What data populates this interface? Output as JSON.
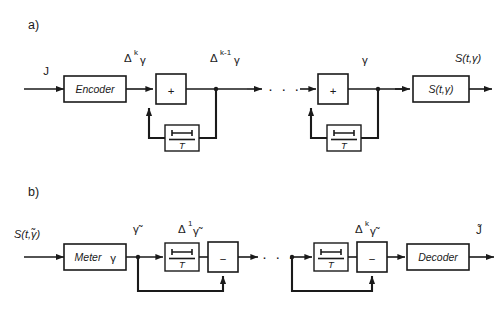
{
  "figure": {
    "type": "block-diagram",
    "panels": [
      {
        "id": "a",
        "label": "a)",
        "input_label": "J",
        "output_label": "S(t,γ)",
        "blocks": [
          {
            "name": "encoder",
            "label": "Encoder",
            "shape": "rect"
          },
          {
            "name": "summing-junction-1",
            "label": "+",
            "shape": "square"
          },
          {
            "name": "delay-1",
            "label": "T",
            "shape": "square",
            "symbol": "delay"
          },
          {
            "name": "summing-junction-2",
            "label": "+",
            "shape": "square"
          },
          {
            "name": "delay-2",
            "label": "T",
            "shape": "square",
            "symbol": "delay"
          },
          {
            "name": "transfer",
            "label": "S(t,γ)",
            "shape": "rect"
          }
        ],
        "signal_labels": [
          {
            "name": "delta-k-gamma",
            "base": "Δ",
            "sup": "k",
            "var": "γ"
          },
          {
            "name": "delta-k-1-gamma",
            "base": "Δ",
            "sup": "k-1",
            "var": "γ"
          },
          {
            "name": "gamma",
            "base": "",
            "sup": "",
            "var": "γ"
          }
        ],
        "ellipsis": "· · ·"
      },
      {
        "id": "b",
        "label": "b)",
        "input_label": "S(t,γ̃)",
        "output_label": "J̃",
        "blocks": [
          {
            "name": "meter",
            "label": "Meter",
            "label2": "γ",
            "shape": "rect"
          },
          {
            "name": "delay-1",
            "label": "T",
            "shape": "square",
            "symbol": "delay"
          },
          {
            "name": "difference-1",
            "label": "−",
            "shape": "square"
          },
          {
            "name": "delay-2",
            "label": "T",
            "shape": "square",
            "symbol": "delay"
          },
          {
            "name": "difference-2",
            "label": "−",
            "shape": "square"
          },
          {
            "name": "decoder",
            "label": "Decoder",
            "shape": "rect"
          }
        ],
        "signal_labels": [
          {
            "name": "gamma-tilde",
            "base": "",
            "sup": "",
            "var": "γ̃"
          },
          {
            "name": "delta-1-gamma-tilde",
            "base": "Δ",
            "sup": "1",
            "var": "γ̃"
          },
          {
            "name": "delta-k-gamma-tilde",
            "base": "Δ",
            "sup": "k",
            "var": "γ̃"
          }
        ],
        "ellipsis": "· · ·"
      }
    ],
    "colors": {
      "line": "#1a1a1a",
      "background": "#ffffff",
      "block_fill": "#ffffff"
    }
  }
}
